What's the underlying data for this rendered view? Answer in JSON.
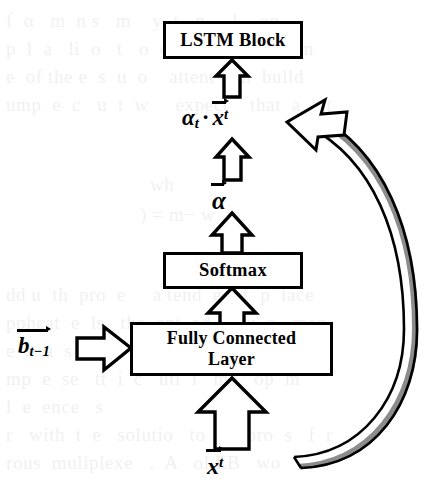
{
  "figure": {
    "width": 440,
    "height": 497,
    "background_color": "#ffffff",
    "stroke_color": "#000000",
    "arrow_fill_color": "#ffffff",
    "curved_arrow_shadow_color": "#8c8c8c"
  },
  "blocks": {
    "lstm": {
      "label": "LSTM Block"
    },
    "softmax": {
      "label": "Softmax"
    },
    "fully_connected": {
      "line1": "Fully Connected",
      "line2": "Layer"
    }
  },
  "labels": {
    "alpha_times_x": {
      "alpha": "α",
      "alpha_subscript": "t",
      "operator": "·",
      "x": "x",
      "x_superscript": "t",
      "plain": "αt · x⃗t"
    },
    "alpha_vector": {
      "symbol": "α",
      "plain": "α⃗"
    },
    "b_previous": {
      "symbol": "b",
      "subscript": "t−1",
      "plain": "b⃗t−1"
    },
    "x_input": {
      "symbol": "x",
      "superscript": "t",
      "plain": "x⃗t"
    }
  },
  "arrows": {
    "softmax_to_alpha": "block-arrow-up",
    "alpha_to_product": "block-arrow-up",
    "product_to_lstm": "block-arrow-up",
    "fc_to_softmax": "block-arrow-up",
    "x_to_fc": "block-arrow-up",
    "b_to_fc": "block-arrow-right",
    "feedback_x_to_product": "curved-block-arrow-left"
  },
  "ghost_text": [
    {
      "x": 6,
      "y": 6,
      "text": "f  α   m  n s   m    y  t   n     l    on"
    },
    {
      "x": 6,
      "y": 34,
      "text": "p  l  a   li  o   t   o  o    n  g  v  y   fltm"
    },
    {
      "x": 6,
      "y": 62,
      "text": "e  of the e  s  u  o    attent o  n  bulld"
    },
    {
      "x": 6,
      "y": 90,
      "text": "ump  e  c   u  t  w     expect    that  a  att"
    },
    {
      "x": 150,
      "y": 170,
      "text": "wh"
    },
    {
      "x": 140,
      "y": 200,
      "text": ") = m− w  m"
    },
    {
      "x": 6,
      "y": 280,
      "text": "dd u  th  pro  e     a tend  e  of  p  laсе"
    },
    {
      "x": 6,
      "y": 308,
      "text": "pphcat  e  ls   the  ent  ed   equ  e   men"
    },
    {
      "x": 6,
      "y": 336,
      "text": "e  s  a  s  st  ce  s  c  d  sid  e  a  tu"
    },
    {
      "x": 6,
      "y": 364,
      "text": "mp  e  se   tt  i  c   uti  i   me   op  m"
    },
    {
      "x": 6,
      "y": 392,
      "text": "l  e  ence   s"
    },
    {
      "x": 6,
      "y": 420,
      "text": "r   wіth  t  e   solutio   to   K  pro  s   f  r"
    },
    {
      "x": 6,
      "y": 448,
      "text": "rous  mulіplexe   .  A   ol EB   wo"
    }
  ]
}
